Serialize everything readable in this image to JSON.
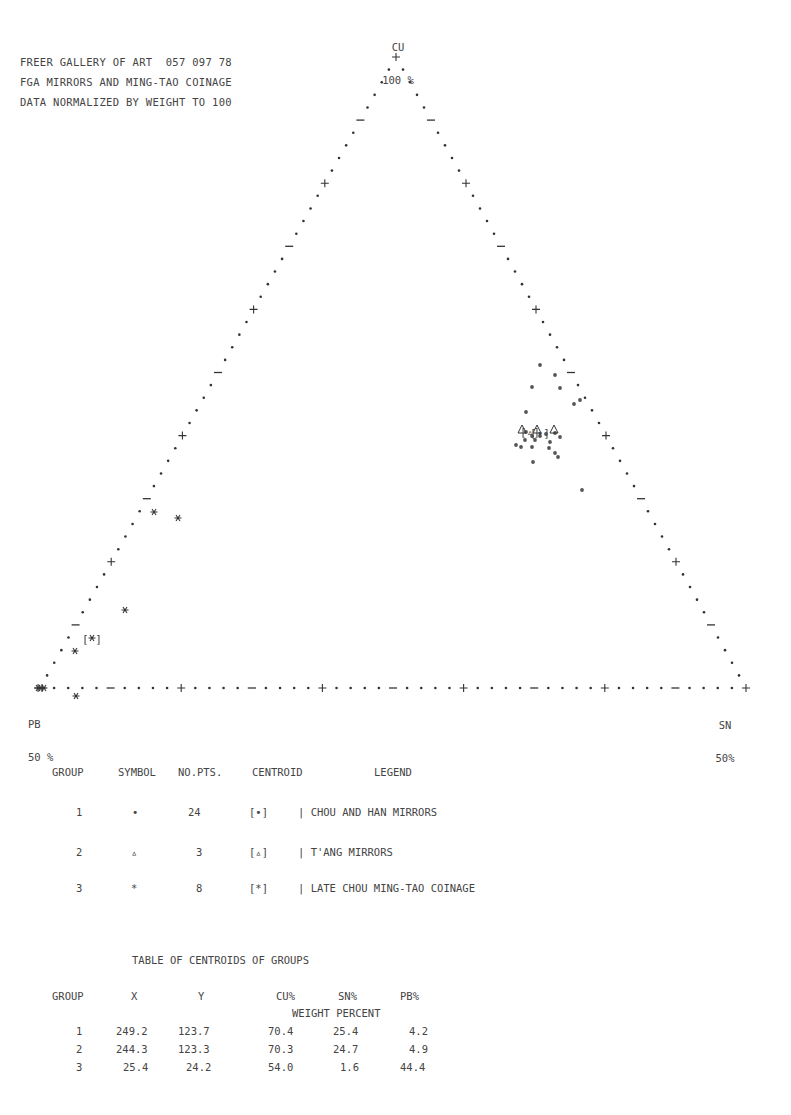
{
  "header": {
    "line1": "FREER GALLERY OF ART  057 097 78",
    "line2": "FGA MIRRORS AND MING-TAO COINAGE",
    "line3": "DATA NORMALIZED BY WEIGHT TO 100"
  },
  "vertices": {
    "top": {
      "element": "CU",
      "pct": "100 %"
    },
    "left": {
      "element": "PB",
      "pct": "50 %"
    },
    "right": {
      "element": "SN",
      "pct": "50%"
    }
  },
  "legend_table": {
    "headers": [
      "GROUP",
      "SYMBOL",
      "NO.PTS.",
      "CENTROID",
      "LEGEND"
    ],
    "rows": [
      {
        "group": "1",
        "symbol": "•",
        "npts": "24",
        "centroid": "[•]",
        "legend": "| CHOU AND HAN MIRRORS"
      },
      {
        "group": "2",
        "symbol": "▵",
        "npts": "3",
        "centroid": "[▵]",
        "legend": "| T'ANG MIRRORS"
      },
      {
        "group": "3",
        "symbol": "*",
        "npts": "8",
        "centroid": "[*]",
        "legend": "| LATE CHOU MING-TAO COINAGE"
      }
    ]
  },
  "centroid_table": {
    "title": "TABLE OF CENTROIDS OF GROUPS",
    "headers": [
      "GROUP",
      "X",
      "Y",
      "CU%",
      "SN%",
      "PB%"
    ],
    "subheader": "WEIGHT PERCENT",
    "rows": [
      {
        "group": "1",
        "x": "249.2",
        "y": "123.7",
        "cu": "70.4",
        "sn": "25.4",
        "pb": "4.2"
      },
      {
        "group": "2",
        "x": "244.3",
        "y": "123.3",
        "cu": "70.3",
        "sn": "24.7",
        "pb": "4.9"
      },
      {
        "group": "3",
        "x": "25.4",
        "y": "24.2",
        "cu": "54.0",
        "sn": "1.6",
        "pb": "44.4"
      }
    ]
  },
  "chart_data": {
    "type": "scatter",
    "subtype": "ternary",
    "title": "FGA MIRRORS AND MING-TAO COINAGE",
    "subtitle": "DATA NORMALIZED BY WEIGHT TO 100",
    "axes": {
      "top": "CU 100 %",
      "left": "PB 50 %",
      "right": "SN 50%"
    },
    "tick_marks": "alternating + and - every 10 dots-interval, 10 intervals per edge",
    "series": [
      {
        "name": "CHOU AND HAN MIRRORS",
        "group": 1,
        "symbol": "dot",
        "n_points": 24,
        "centroid": {
          "x": 249.2,
          "y": 123.7,
          "cu": 70.4,
          "sn": 25.4,
          "pb": 4.2
        }
      },
      {
        "name": "T'ANG MIRRORS",
        "group": 2,
        "symbol": "triangle",
        "n_points": 3,
        "centroid": {
          "x": 244.3,
          "y": 123.3,
          "cu": 70.3,
          "sn": 24.7,
          "pb": 4.9
        }
      },
      {
        "name": "LATE CHOU MING-TAO COINAGE",
        "group": 3,
        "symbol": "asterisk",
        "n_points": 8,
        "centroid": {
          "x": 25.4,
          "y": 24.2,
          "cu": 54.0,
          "sn": 1.6,
          "pb": 44.4
        }
      }
    ],
    "points_px": {
      "group1": [
        [
          540,
          365
        ],
        [
          555,
          375
        ],
        [
          532,
          387
        ],
        [
          560,
          388
        ],
        [
          574,
          404
        ],
        [
          580,
          400
        ],
        [
          526,
          412
        ],
        [
          516,
          445
        ],
        [
          521,
          447
        ],
        [
          532,
          447
        ],
        [
          549,
          448
        ],
        [
          555,
          453
        ],
        [
          558,
          457
        ],
        [
          533,
          462
        ],
        [
          582,
          490
        ],
        [
          526,
          432
        ],
        [
          532,
          436
        ],
        [
          540,
          436
        ],
        [
          546,
          434
        ],
        [
          555,
          433
        ],
        [
          525,
          440
        ],
        [
          535,
          440
        ],
        [
          560,
          437
        ],
        [
          550,
          442
        ]
      ],
      "group2": [
        [
          522,
          430
        ],
        [
          537,
          430
        ],
        [
          554,
          430
        ]
      ],
      "group3": [
        [
          154,
          512
        ],
        [
          178,
          518
        ],
        [
          125,
          610
        ],
        [
          75,
          651
        ],
        [
          76,
          696
        ],
        [
          38,
          688
        ],
        [
          41,
          688
        ],
        [
          44,
          688
        ]
      ],
      "centroid3": [
        92,
        639
      ],
      "centroid1": [
        540,
        433
      ],
      "centroid2": [
        530,
        432
      ]
    }
  }
}
